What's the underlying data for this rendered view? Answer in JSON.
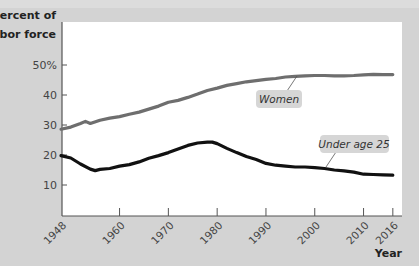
{
  "chart_data": {
    "type": "line",
    "title": "",
    "ylabel": "Percent of labor force",
    "xlabel": "Year",
    "ylim": [
      0,
      55
    ],
    "xlim": [
      1948,
      2017.5
    ],
    "yticks": [
      10,
      20,
      30,
      40,
      50
    ],
    "ytick_labels": [
      "10",
      "20",
      "30",
      "40",
      "50%"
    ],
    "xticks": [
      1948,
      1960,
      1970,
      1980,
      1990,
      2000,
      2010,
      2016
    ],
    "xtick_labels": [
      "1948",
      "1960",
      "1970",
      "1980",
      "1990",
      "2000",
      "2010",
      "2016"
    ],
    "grid": false,
    "legend": "inline callouts",
    "series": [
      {
        "name": "Women",
        "color": "#6e6e6e",
        "x": [
          1948,
          1950,
          1952,
          1953,
          1954,
          1956,
          1958,
          1960,
          1962,
          1964,
          1966,
          1968,
          1970,
          1972,
          1974,
          1976,
          1978,
          1980,
          1982,
          1984,
          1986,
          1988,
          1990,
          1992,
          1994,
          1996,
          1998,
          2000,
          2002,
          2004,
          2006,
          2008,
          2010,
          2012,
          2014,
          2016
        ],
        "values": [
          28.6,
          29.3,
          30.5,
          31.2,
          30.5,
          31.6,
          32.3,
          32.8,
          33.6,
          34.3,
          35.3,
          36.3,
          37.6,
          38.2,
          39.2,
          40.3,
          41.5,
          42.3,
          43.2,
          43.8,
          44.4,
          44.8,
          45.2,
          45.5,
          46.0,
          46.2,
          46.4,
          46.5,
          46.5,
          46.4,
          46.4,
          46.5,
          46.7,
          46.9,
          46.8,
          46.8
        ]
      },
      {
        "name": "Under age 25",
        "color": "#111111",
        "x": [
          1948,
          1950,
          1952,
          1954,
          1955,
          1956,
          1958,
          1960,
          1962,
          1964,
          1966,
          1968,
          1970,
          1972,
          1974,
          1976,
          1978,
          1979,
          1980,
          1982,
          1984,
          1986,
          1988,
          1990,
          1992,
          1994,
          1996,
          1998,
          2000,
          2002,
          2004,
          2006,
          2008,
          2010,
          2012,
          2014,
          2016
        ],
        "values": [
          19.8,
          19.0,
          17.0,
          15.3,
          14.8,
          15.2,
          15.5,
          16.3,
          16.8,
          17.7,
          18.9,
          19.8,
          20.8,
          22.0,
          23.2,
          24.0,
          24.3,
          24.3,
          23.8,
          22.2,
          20.8,
          19.5,
          18.5,
          17.2,
          16.6,
          16.3,
          16.0,
          16.0,
          15.8,
          15.5,
          15.0,
          14.7,
          14.3,
          13.6,
          13.5,
          13.4,
          13.3
        ]
      }
    ],
    "annotations": [
      {
        "text": "Women",
        "series": "Women",
        "anchor_year": 1998
      },
      {
        "text": "Under age 25",
        "series": "Under age 25",
        "anchor_year": 2000
      }
    ]
  },
  "axis": {
    "ylabel_line1": "Percent of",
    "ylabel_line2": "labor force",
    "xlabel": "Year"
  },
  "labels": {
    "women": "Women",
    "under25": "Under age 25"
  },
  "colors": {
    "figure_bg": "#d3d3d3",
    "plot_bg": "#ffffff",
    "women_line": "#6e6e6e",
    "under25_line": "#111111",
    "callout_bg": "#d6d6d6"
  }
}
